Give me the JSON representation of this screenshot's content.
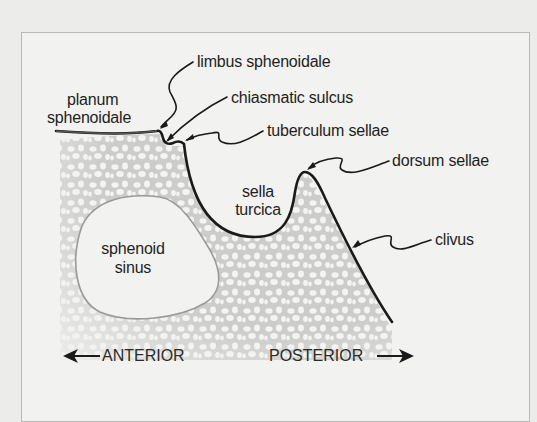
{
  "diagram": {
    "labels": {
      "limbus_sphenoidale": "limbus sphenoidale",
      "planum_line1": "planum",
      "planum_line2": "sphenoidale",
      "chiasmatic_sulcus": "chiasmatic sulcus",
      "tuberculum_sellae": "tuberculum sellae",
      "dorsum_sellae": "dorsum sellae",
      "sella_line1": "sella",
      "sella_line2": "turcica",
      "clivus": "clivus",
      "sinus_line1": "sphenoid",
      "sinus_line2": "sinus"
    },
    "orientation": {
      "anterior": "ANTERIOR",
      "posterior": "POSTERIOR"
    },
    "colors": {
      "background": "#ececea",
      "frame_fill": "#f2f2f0",
      "frame_border": "#b9b9b6",
      "cortical_line": "#1a1a1a",
      "spongy_bone": "#c8c8c6",
      "sinus_outline": "#9a9a98",
      "text": "#1e1e1e"
    }
  }
}
